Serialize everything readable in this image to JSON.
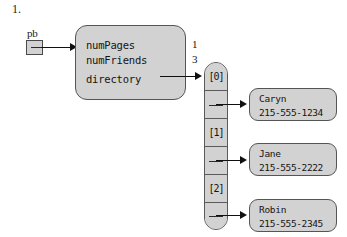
{
  "figure": {
    "item_number": "1.",
    "pointer_variable_label": "pb"
  },
  "object": {
    "fields": [
      {
        "name": "numPages",
        "value": "1"
      },
      {
        "name": "numFriends",
        "value": "3"
      },
      {
        "name": "directory",
        "value": ""
      }
    ]
  },
  "array": {
    "cells": [
      {
        "label": "[0]",
        "kind": "index"
      },
      {
        "label": "",
        "kind": "pointer"
      },
      {
        "label": "[1]",
        "kind": "index"
      },
      {
        "label": "",
        "kind": "pointer"
      },
      {
        "label": "[2]",
        "kind": "index"
      },
      {
        "label": "",
        "kind": "pointer"
      }
    ]
  },
  "entries": [
    {
      "name": "Caryn",
      "phone": "215-555-1234"
    },
    {
      "name": "Jane",
      "phone": "215-555-2222"
    },
    {
      "name": "Robin",
      "phone": "215-555-2345"
    }
  ],
  "colors": {
    "box_fill": "#d2d2d2",
    "array_fill": "#c8c8c8",
    "stroke": "#555555",
    "arrow": "#101010",
    "text": "#141414",
    "background": "#ffffff"
  }
}
